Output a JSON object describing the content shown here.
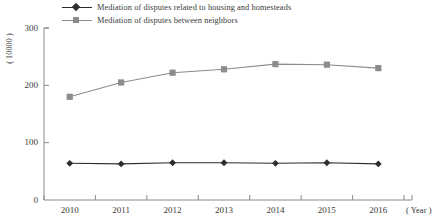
{
  "chart_data": {
    "type": "line",
    "title": "",
    "xlabel": "( Year )",
    "ylabel": "( 10000 )",
    "categories": [
      "2010",
      "2011",
      "2012",
      "2013",
      "2014",
      "2015",
      "2016"
    ],
    "x": [
      2010,
      2011,
      2012,
      2013,
      2014,
      2015,
      2016
    ],
    "ylim": [
      0,
      300
    ],
    "xlim": [
      2009.6,
      2016.6
    ],
    "yticks": [
      0,
      100,
      200,
      300
    ],
    "ytick_labels": [
      "0",
      "100",
      "200",
      "300"
    ],
    "grid": false,
    "legend_position": "top-left",
    "series": [
      {
        "name": "Mediation of disputes related to housing and homesteads",
        "marker": "diamond",
        "color": "#2e2e2e",
        "values": [
          64,
          63,
          65,
          65,
          64,
          65,
          63
        ]
      },
      {
        "name": "Mediation of disputes between neighbors",
        "marker": "square",
        "color": "#8c8c8c",
        "values": [
          180,
          205,
          222,
          228,
          237,
          236,
          230
        ]
      }
    ]
  },
  "axes": {
    "y_unit_label": "( 10000 )",
    "x_unit_label": "( Year )"
  },
  "colors": {
    "series_1": "#2e2e2e",
    "series_2": "#8c8c8c",
    "axis": "#8a8a8a",
    "text": "#3a3a3a",
    "background": "#ffffff"
  }
}
